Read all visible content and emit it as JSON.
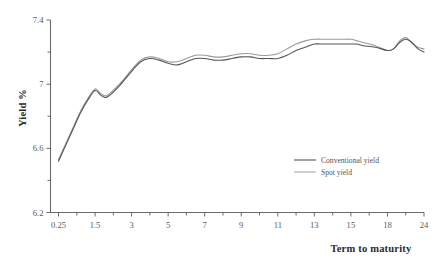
{
  "chart_data": {
    "type": "line",
    "title": "",
    "subtitle": "",
    "xlabel": "Term to maturity",
    "ylabel": "Yield %",
    "grid": false,
    "legend_position": "inside-right-lower",
    "x_tick_labels": [
      "0.25",
      "1.5",
      "3",
      "5",
      "7",
      "9",
      "11",
      "13",
      "15",
      "18",
      "24"
    ],
    "y_tick_labels": [
      "6.2",
      "6.6",
      "7",
      "7.4"
    ],
    "y_minor_tick_labels": [
      "6.4",
      "6.8",
      "7.2"
    ],
    "ylim": [
      6.2,
      7.4
    ],
    "xlim": [
      0.25,
      24
    ],
    "x": [
      0.25,
      0.5,
      0.75,
      1,
      1.25,
      1.5,
      1.75,
      2,
      2.5,
      3,
      3.5,
      4,
      4.5,
      5,
      5.5,
      6,
      6.5,
      7,
      7.5,
      8,
      8.5,
      9,
      9.5,
      10,
      10.5,
      11,
      11.5,
      12,
      12.5,
      13,
      13.5,
      14,
      14.5,
      15,
      15.5,
      16,
      17,
      18,
      19,
      20,
      21,
      22,
      23,
      24
    ],
    "series": [
      {
        "name": "Conventional yield",
        "color": "#555555",
        "width": 1.1,
        "values": [
          6.52,
          6.62,
          6.72,
          6.82,
          6.9,
          6.96,
          6.93,
          6.92,
          6.99,
          7.08,
          7.14,
          7.16,
          7.15,
          7.13,
          7.12,
          7.14,
          7.16,
          7.16,
          7.15,
          7.15,
          7.16,
          7.17,
          7.17,
          7.16,
          7.16,
          7.16,
          7.18,
          7.21,
          7.23,
          7.25,
          7.25,
          7.25,
          7.25,
          7.25,
          7.25,
          7.24,
          7.23,
          7.21,
          7.22,
          7.26,
          7.28,
          7.26,
          7.22,
          7.2
        ]
      },
      {
        "name": "Spot yield",
        "color": "#9a9a9a",
        "width": 1.1,
        "values": [
          6.53,
          6.63,
          6.73,
          6.83,
          6.91,
          6.97,
          6.94,
          6.93,
          7.0,
          7.09,
          7.15,
          7.17,
          7.16,
          7.14,
          7.14,
          7.16,
          7.18,
          7.18,
          7.17,
          7.17,
          7.18,
          7.19,
          7.19,
          7.18,
          7.18,
          7.19,
          7.22,
          7.25,
          7.27,
          7.28,
          7.28,
          7.28,
          7.28,
          7.28,
          7.27,
          7.26,
          7.24,
          7.21,
          7.22,
          7.27,
          7.29,
          7.26,
          7.23,
          7.22
        ]
      }
    ],
    "legend": [
      {
        "label": "Conventional yield",
        "color": "#555555"
      },
      {
        "label": "Spot yield",
        "color": "#a8a8a8"
      }
    ]
  },
  "axes": {
    "color": "#6b6b6b",
    "tick_color": "#6b6b6b"
  }
}
